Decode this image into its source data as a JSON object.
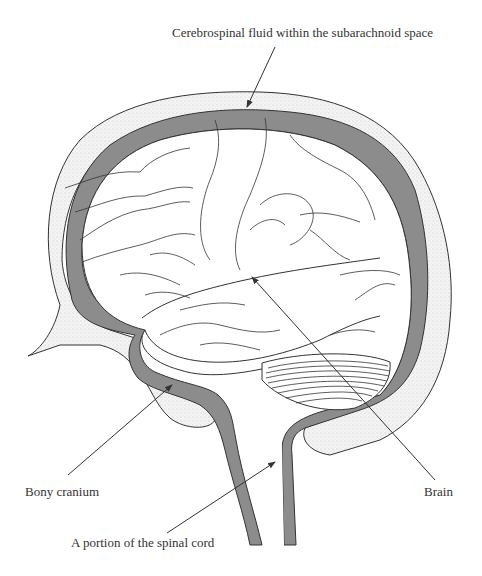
{
  "diagram": {
    "type": "anatomical-illustration",
    "labels": {
      "csf": "Cerebrospinal fluid within the subarachnoid space",
      "cranium": "Bony cranium",
      "brain": "Brain",
      "spinal_cord": "A portion of the spinal cord"
    },
    "colors": {
      "csf_fill": "#8c8c8c",
      "bone_fill": "#efefef",
      "outline": "#333333",
      "background": "#ffffff"
    }
  }
}
